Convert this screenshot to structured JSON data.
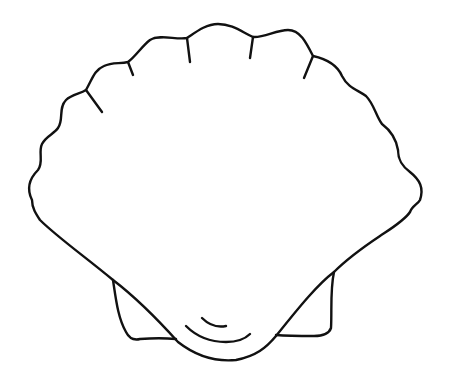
{
  "image": {
    "subject": "scallop shell outline drawing",
    "background_color": "#ffffff",
    "stroke_color": "#111111",
    "parts": [
      {
        "id": "shell-outline",
        "label": "Scalloped shell outline"
      },
      {
        "id": "rib-lines",
        "label": "Rib lines (6)"
      },
      {
        "id": "left-ear",
        "label": "Left hinge ear"
      },
      {
        "id": "right-ear",
        "label": "Right hinge ear"
      },
      {
        "id": "umbo-arcs",
        "label": "Umbo growth arcs (2)"
      }
    ]
  }
}
